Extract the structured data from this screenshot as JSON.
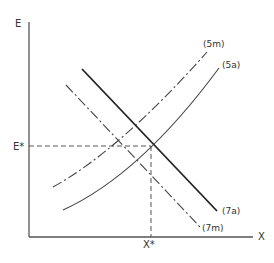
{
  "diagram": {
    "axes": {
      "y_label": "E",
      "x_label": "X"
    },
    "equilibrium": {
      "y_label": "E*",
      "x_label": "X*"
    },
    "curves": [
      {
        "id": "5m",
        "label": "(5m)",
        "style": "dash-dot",
        "direction": "upward"
      },
      {
        "id": "5a",
        "label": "(5a)",
        "style": "solid-thin",
        "direction": "upward"
      },
      {
        "id": "7a",
        "label": "(7a)",
        "style": "solid-thick",
        "direction": "downward"
      },
      {
        "id": "7m",
        "label": "(7m)",
        "style": "dash-dot",
        "direction": "downward"
      }
    ],
    "colors": {
      "line": "#333333",
      "background": "#ffffff"
    }
  }
}
